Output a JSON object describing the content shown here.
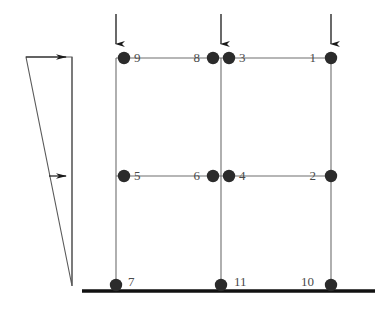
{
  "diagram": {
    "type": "structural-frame-node-diagram",
    "colors": {
      "node": "#2b2b2b",
      "member": "#6e6e6e",
      "ground": "#111111",
      "load_outline": "#555555",
      "arrow": "#1a1a1a",
      "label": "#4a4a4a",
      "background": "#ffffff"
    },
    "geometry": {
      "columns_x": [
        116,
        221,
        331
      ],
      "levels_y": [
        58,
        176,
        287
      ],
      "ground_line_y": 291,
      "ground_line_x1": 82,
      "ground_line_x2": 375
    },
    "nodes": [
      {
        "id": "1",
        "label": "1",
        "cx": 331,
        "cy": 58,
        "label_x": 316,
        "label_y": 59,
        "level": "roof",
        "column": "right"
      },
      {
        "id": "2",
        "label": "2",
        "cx": 331,
        "cy": 176,
        "label_x": 316,
        "label_y": 177,
        "level": "floor",
        "column": "right"
      },
      {
        "id": "3",
        "label": "3",
        "cx": 229,
        "cy": 58,
        "label_x": 239,
        "label_y": 59,
        "level": "roof",
        "column": "middle-right"
      },
      {
        "id": "4",
        "label": "4",
        "cx": 229,
        "cy": 176,
        "label_x": 239,
        "label_y": 177,
        "level": "floor",
        "column": "middle-right"
      },
      {
        "id": "5",
        "label": "5",
        "cx": 124,
        "cy": 176,
        "label_x": 134,
        "label_y": 177,
        "level": "floor",
        "column": "left"
      },
      {
        "id": "6",
        "label": "6",
        "cx": 213,
        "cy": 176,
        "label_x": 198,
        "label_y": 177,
        "level": "floor",
        "column": "middle-left"
      },
      {
        "id": "7",
        "label": "7",
        "cx": 116,
        "cy": 285,
        "label_x": 128,
        "label_y": 283,
        "level": "base",
        "column": "left"
      },
      {
        "id": "8",
        "label": "8",
        "cx": 213,
        "cy": 58,
        "label_x": 198,
        "label_y": 59,
        "level": "roof",
        "column": "middle-left"
      },
      {
        "id": "9",
        "label": "9",
        "cx": 124,
        "cy": 58,
        "label_x": 134,
        "label_y": 59,
        "level": "roof",
        "column": "left"
      },
      {
        "id": "10",
        "label": "10",
        "cx": 331,
        "cy": 285,
        "label_x": 311,
        "label_y": 283,
        "level": "base",
        "column": "right"
      },
      {
        "id": "11",
        "label": "11",
        "cx": 221,
        "cy": 285,
        "label_x": 234,
        "label_y": 283,
        "level": "base",
        "column": "middle"
      }
    ],
    "members": {
      "beams": [
        {
          "name": "roof-beam-left",
          "x1": 116,
          "y1": 58,
          "x2": 221,
          "y2": 58
        },
        {
          "name": "roof-beam-right",
          "x1": 221,
          "y1": 58,
          "x2": 331,
          "y2": 58
        },
        {
          "name": "floor-beam-left",
          "x1": 116,
          "y1": 176,
          "x2": 221,
          "y2": 176
        },
        {
          "name": "floor-beam-right",
          "x1": 221,
          "y1": 176,
          "x2": 331,
          "y2": 176
        }
      ],
      "columns": [
        {
          "name": "left-column-upper",
          "x1": 116,
          "y1": 58,
          "x2": 116,
          "y2": 176
        },
        {
          "name": "left-column-lower",
          "x1": 116,
          "y1": 176,
          "x2": 116,
          "y2": 291
        },
        {
          "name": "middle-column-upper",
          "x1": 221,
          "y1": 58,
          "x2": 221,
          "y2": 176
        },
        {
          "name": "middle-column-lower",
          "x1": 221,
          "y1": 176,
          "x2": 221,
          "y2": 291
        },
        {
          "name": "right-column-upper",
          "x1": 331,
          "y1": 58,
          "x2": 331,
          "y2": 176
        },
        {
          "name": "right-column-lower",
          "x1": 331,
          "y1": 176,
          "x2": 331,
          "y2": 291
        }
      ]
    },
    "vertical_loads": [
      {
        "name": "vertical-load-left",
        "x": 116,
        "y_start": 14,
        "y_end": 50
      },
      {
        "name": "vertical-load-middle",
        "x": 221,
        "y_start": 14,
        "y_end": 50
      },
      {
        "name": "vertical-load-right",
        "x": 331,
        "y_start": 14,
        "y_end": 50
      }
    ],
    "lateral_load": {
      "name": "triangular-lateral-load",
      "shape": "triangle",
      "apex_x": 72,
      "apex_y": 286,
      "top_left_x": 26,
      "top_left_y": 57,
      "top_right_x": 72,
      "top_right_y": 57,
      "baseline_x": 72,
      "arrows": [
        {
          "name": "lateral-arrow-roof",
          "x_start": 26,
          "x_end": 72,
          "y": 57
        },
        {
          "name": "lateral-arrow-floor",
          "x_start": 49,
          "x_end": 72,
          "y": 176
        }
      ]
    }
  }
}
